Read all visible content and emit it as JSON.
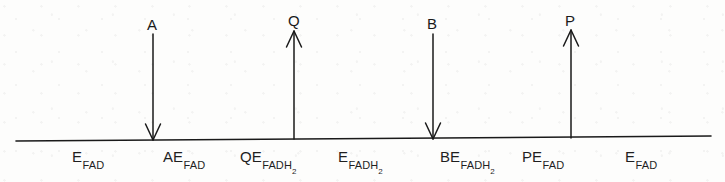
{
  "figure": {
    "type": "cleland-notation-diagram",
    "background_color": "#fdfdfc",
    "ink_color": "#1a1a1a"
  },
  "baseline": {
    "name": "reaction-progress-line",
    "x_start": 16,
    "y_start": 141,
    "x_end": 711,
    "y_end": 136,
    "stroke_width": 1.6
  },
  "arrows": [
    {
      "label": "A",
      "direction": "down",
      "meaning": "substrate-binding",
      "x": 153,
      "y_tail": 34,
      "y_head": 140,
      "label_x": 147,
      "label_y": 16
    },
    {
      "label": "Q",
      "direction": "up",
      "meaning": "product-release",
      "x": 294,
      "y_tail": 139,
      "y_head": 31,
      "label_x": 288,
      "label_y": 12
    },
    {
      "label": "B",
      "direction": "down",
      "meaning": "substrate-binding",
      "x": 433,
      "y_tail": 34,
      "y_head": 139,
      "label_x": 427,
      "label_y": 15
    },
    {
      "label": "P",
      "direction": "up",
      "meaning": "product-release",
      "x": 571,
      "y_tail": 138,
      "y_head": 30,
      "label_x": 565,
      "label_y": 12
    }
  ],
  "states": [
    {
      "prefix": "E",
      "sub": "FAD",
      "sub2": "",
      "x": 72,
      "y": 149
    },
    {
      "prefix": "AE",
      "sub": "FAD",
      "sub2": "",
      "x": 163,
      "y": 149
    },
    {
      "prefix": "QE",
      "sub": "FADH",
      "sub2": "2",
      "x": 240,
      "y": 149
    },
    {
      "prefix": "E",
      "sub": "FADH",
      "sub2": "2",
      "x": 338,
      "y": 149
    },
    {
      "prefix": "BE",
      "sub": "FADH",
      "sub2": "2",
      "x": 440,
      "y": 149
    },
    {
      "prefix": "PE",
      "sub": "FAD",
      "sub2": "",
      "x": 522,
      "y": 149
    },
    {
      "prefix": "E",
      "sub": "FAD",
      "sub2": "",
      "x": 625,
      "y": 149
    }
  ]
}
